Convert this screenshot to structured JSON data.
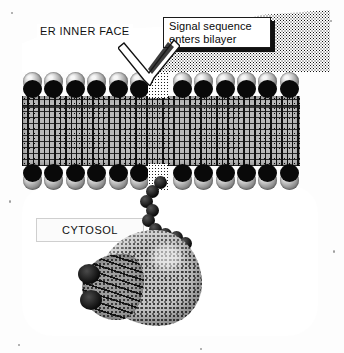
{
  "figure": {
    "title_labels": {
      "er_inner_face": "ER INNER FACE",
      "cytosol": "CYTOSOL"
    },
    "callout": {
      "line1": "Signal sequence",
      "line2": "enters bilayer"
    },
    "annotation_arrow": {
      "name": "arrow-to-bilayer-gap",
      "direction": "down-left"
    },
    "structures": [
      {
        "name": "er-lumen-stipple",
        "label": "ER lumen (stippled region)"
      },
      {
        "name": "lipid-bilayer",
        "label": "Lipid bilayer"
      },
      {
        "name": "phospholipid-head-group",
        "label": "Phospholipid head group"
      },
      {
        "name": "hydrophobic-tail-core",
        "label": "Hydrophobic tail core"
      },
      {
        "name": "insertion-gap",
        "label": "Bilayer insertion gap"
      },
      {
        "name": "polypeptide-chain",
        "label": "Nascent polypeptide chain"
      },
      {
        "name": "ribosome",
        "label": "Ribosome"
      },
      {
        "name": "cytosol-stipple",
        "label": "Cytosol (stippled region)"
      }
    ],
    "colors": {
      "head_group_dark": "#090909",
      "head_group_light": "#9a9a9a",
      "tail_core": "#b9b9b9",
      "ribosome_body": "#c3c3c3",
      "stipple_ink": "#111111",
      "background": "#ffffff"
    },
    "bead_count": 9,
    "head_group_count_per_row": 13
  }
}
